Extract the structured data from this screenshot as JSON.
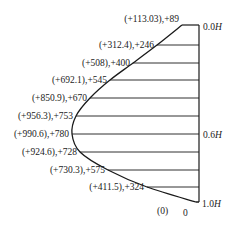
{
  "diagram": {
    "type": "pressure-distribution",
    "axis_labels": {
      "top": "0.0",
      "mid": "0.6",
      "bottom": "1.0",
      "unit": "H"
    },
    "bottom_labels": {
      "paren_zero": "(0)",
      "zero": "0"
    },
    "rows": [
      {
        "label": "(+113.03),+89",
        "y": 25,
        "x": 182
      },
      {
        "label": "(+312.4),+246",
        "y": 45,
        "x": 157
      },
      {
        "label": "(+508),+400",
        "y": 63,
        "x": 133
      },
      {
        "label": "(+692.1),+545",
        "y": 80,
        "x": 110
      },
      {
        "label": "(+850.9),+670",
        "y": 98,
        "x": 90
      },
      {
        "label": "(+956.3),+753",
        "y": 116,
        "x": 76
      },
      {
        "label": "(+990.6),+780",
        "y": 134,
        "x": 72
      },
      {
        "label": "(+924.6),+728",
        "y": 152,
        "x": 80
      },
      {
        "label": "(+730.3),+575",
        "y": 170,
        "x": 108
      },
      {
        "label": "(+411.5),+324",
        "y": 187,
        "x": 147
      }
    ],
    "bottom_point": {
      "x": 196,
      "y": 202
    }
  }
}
